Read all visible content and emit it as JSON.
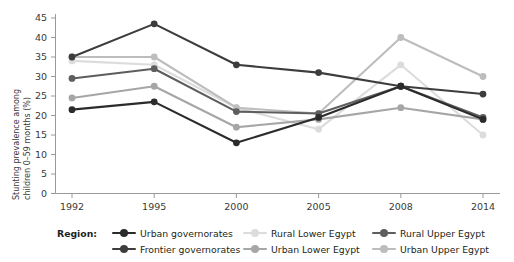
{
  "chart_data": {
    "type": "line",
    "title": "",
    "subtitle": "",
    "xlabel": "",
    "ylabel": "Stunting prevalence among\nchildren 0–59 months (%)",
    "ylabel_line1": "Stunting prevalence among",
    "ylabel_line2": "children 0–59 months (%)",
    "categories": [
      "1992",
      "1995",
      "2000",
      "2005",
      "2008",
      "2014"
    ],
    "x": [
      1992,
      1995,
      2000,
      2005,
      2008,
      2014
    ],
    "ylim": [
      0,
      45
    ],
    "yticks": [
      0,
      5,
      10,
      15,
      20,
      25,
      30,
      35,
      40,
      45
    ],
    "ytick_labels": [
      "0",
      "5",
      "10",
      "15",
      "20",
      "25",
      "30",
      "35",
      "40",
      "45"
    ],
    "xtick_labels": [
      "1992",
      "1995",
      "2000",
      "2005",
      "2008",
      "2014"
    ],
    "grid": false,
    "legend_position": "bottom",
    "legend_title": "Region:",
    "series": [
      {
        "name": "Urban governorates",
        "color": "#2b2b2b",
        "values": [
          21.5,
          23.5,
          13.0,
          19.5,
          27.5,
          19.0
        ]
      },
      {
        "name": "Frontier governorates",
        "color": "#3d3d3d",
        "values": [
          35.0,
          43.5,
          33.0,
          31.0,
          27.5,
          25.5
        ]
      },
      {
        "name": "Rural Lower Egypt",
        "color": "#dcdcdc",
        "values": [
          34.0,
          33.0,
          22.0,
          16.5,
          33.0,
          15.0
        ]
      },
      {
        "name": "Urban Lower Egypt",
        "color": "#a6a6a6",
        "values": [
          24.5,
          27.5,
          17.0,
          19.0,
          22.0,
          19.0
        ]
      },
      {
        "name": "Rural Upper Egypt",
        "color": "#5e5e5e",
        "values": [
          29.5,
          32.0,
          21.0,
          20.5,
          27.5,
          19.5
        ]
      },
      {
        "name": "Urban Upper Egypt",
        "color": "#bdbdbd",
        "values": [
          35.0,
          35.0,
          22.0,
          20.5,
          40.0,
          30.0
        ]
      }
    ]
  },
  "legend": {
    "title": "Region:",
    "entries": [
      {
        "label": "Urban governorates",
        "color": "#2b2b2b"
      },
      {
        "label": "Frontier governorates",
        "color": "#3d3d3d"
      },
      {
        "label": "Rural Lower Egypt",
        "color": "#dcdcdc"
      },
      {
        "label": "Urban Lower Egypt",
        "color": "#a6a6a6"
      },
      {
        "label": "Rural Upper Egypt",
        "color": "#5e5e5e"
      },
      {
        "label": "Urban Upper Egypt",
        "color": "#bdbdbd"
      }
    ]
  },
  "axes": {
    "y_title_line1": "Stunting prevalence among",
    "y_title_line2": "children 0–59 months (%)",
    "axis_color": "#9a9a9a"
  },
  "colors": {
    "background": "#ffffff",
    "text": "#231f20",
    "axis": "#9a9a9a"
  }
}
